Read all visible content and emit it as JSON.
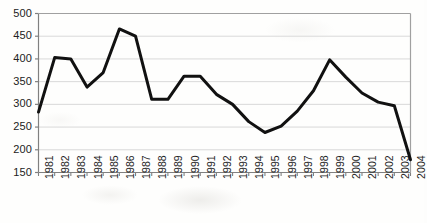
{
  "chart_data": {
    "type": "line",
    "title": "",
    "xlabel": "",
    "ylabel": "",
    "categories": [
      "1981",
      "1982",
      "1983",
      "1984",
      "1985",
      "1986",
      "1987",
      "1988",
      "1989",
      "1990",
      "1991",
      "1992",
      "1993",
      "1994",
      "1995",
      "1996",
      "1997",
      "1998",
      "1999",
      "2000",
      "2001",
      "2002",
      "2003",
      "2004"
    ],
    "values": [
      283,
      403,
      400,
      338,
      370,
      466,
      450,
      311,
      311,
      362,
      362,
      322,
      300,
      262,
      238,
      252,
      285,
      330,
      398,
      360,
      325,
      305,
      297,
      178
    ],
    "series": [
      {
        "name": "series-1",
        "values": [
          283,
          403,
          400,
          338,
          370,
          466,
          450,
          311,
          311,
          362,
          362,
          322,
          300,
          262,
          238,
          252,
          285,
          330,
          398,
          360,
          325,
          305,
          297,
          178
        ],
        "color": "#111111"
      }
    ],
    "ylim": [
      150,
      500
    ],
    "ytick_labels": [
      "500",
      "450",
      "400",
      "350",
      "300",
      "250",
      "200",
      "150"
    ],
    "ytick_values": [
      500,
      450,
      400,
      350,
      300,
      250,
      200,
      150
    ],
    "xlim": [
      1981,
      2004
    ],
    "grid": "horizontal",
    "grid_color": "#d9d9d9",
    "legend": "none",
    "axis_color": "#808080",
    "line_width": 3,
    "background": "#fefefd"
  }
}
